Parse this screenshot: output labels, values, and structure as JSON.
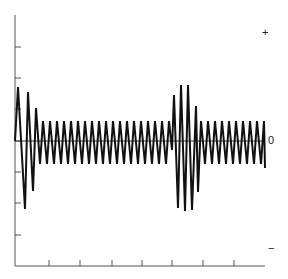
{
  "chart_data": {
    "type": "line",
    "title": "",
    "xlabel": "",
    "ylabel": "",
    "y_symbols": {
      "top": "+",
      "zero": "0",
      "bottom": "−"
    },
    "grid": false,
    "legend": null,
    "axes": {
      "plot_px": {
        "x0": 15,
        "x1": 265,
        "y_top": 15,
        "y_zero": 141,
        "y_bottom": 266
      },
      "y_ticks_px": [
        47,
        78,
        109,
        141,
        172,
        203,
        235
      ],
      "x_ticks_px": [
        49,
        80,
        112,
        142,
        172,
        203,
        234
      ]
    },
    "ylim": [
      -4,
      4
    ],
    "steady_amplitude": 0.65,
    "series": [
      {
        "name": "signal",
        "points_px": [
          [
            15,
            141
          ],
          [
            18,
            87
          ],
          [
            25,
            209
          ],
          [
            28,
            92
          ],
          [
            33,
            191
          ],
          [
            36,
            108
          ],
          [
            40,
            164
          ],
          [
            43,
            121
          ],
          [
            47,
            164
          ],
          [
            50,
            121
          ],
          [
            54,
            164
          ],
          [
            57,
            121
          ],
          [
            61,
            164
          ],
          [
            64,
            121
          ],
          [
            68,
            164
          ],
          [
            71,
            121
          ],
          [
            75,
            164
          ],
          [
            78,
            121
          ],
          [
            82,
            164
          ],
          [
            85,
            121
          ],
          [
            89,
            164
          ],
          [
            92,
            121
          ],
          [
            96,
            164
          ],
          [
            99,
            121
          ],
          [
            103,
            164
          ],
          [
            106,
            121
          ],
          [
            110,
            164
          ],
          [
            113,
            121
          ],
          [
            117,
            164
          ],
          [
            120,
            121
          ],
          [
            124,
            164
          ],
          [
            127,
            121
          ],
          [
            131,
            164
          ],
          [
            134,
            121
          ],
          [
            138,
            164
          ],
          [
            141,
            121
          ],
          [
            145,
            164
          ],
          [
            148,
            121
          ],
          [
            152,
            164
          ],
          [
            155,
            121
          ],
          [
            159,
            164
          ],
          [
            162,
            121
          ],
          [
            166,
            164
          ],
          [
            169,
            121
          ],
          [
            172,
            150
          ],
          [
            174,
            95
          ],
          [
            178,
            208
          ],
          [
            181,
            85
          ],
          [
            185,
            211
          ],
          [
            188,
            85
          ],
          [
            192,
            210
          ],
          [
            196,
            106
          ],
          [
            198,
            192
          ],
          [
            201,
            121
          ],
          [
            205,
            164
          ],
          [
            208,
            121
          ],
          [
            212,
            164
          ],
          [
            215,
            121
          ],
          [
            219,
            164
          ],
          [
            222,
            121
          ],
          [
            226,
            164
          ],
          [
            229,
            121
          ],
          [
            233,
            164
          ],
          [
            236,
            121
          ],
          [
            240,
            164
          ],
          [
            243,
            121
          ],
          [
            247,
            164
          ],
          [
            250,
            121
          ],
          [
            254,
            164
          ],
          [
            257,
            121
          ],
          [
            261,
            164
          ],
          [
            264,
            121
          ],
          [
            265,
            168
          ]
        ]
      }
    ]
  }
}
